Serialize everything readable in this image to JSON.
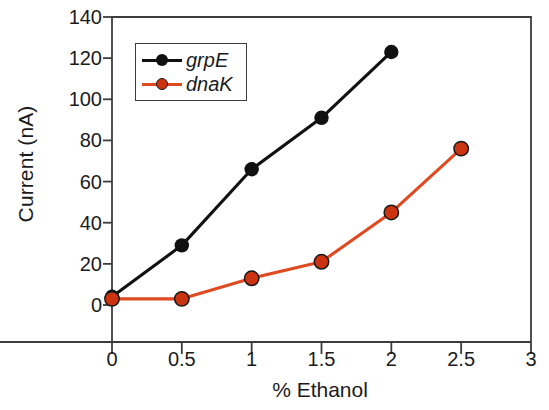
{
  "chart_data": {
    "type": "line",
    "title": "",
    "xlabel": "% Ethanol",
    "ylabel": "Current (nA)",
    "xlim": [
      0,
      3
    ],
    "ylim": [
      0,
      140
    ],
    "xticks": [
      "0",
      "0.5",
      "1",
      "1.5",
      "2",
      "2.5",
      "3"
    ],
    "xtick_values": [
      0,
      0.5,
      1,
      1.5,
      2,
      2.5,
      3
    ],
    "yticks": [
      "0",
      "20",
      "40",
      "60",
      "80",
      "100",
      "120",
      "140"
    ],
    "ytick_values": [
      0,
      20,
      40,
      60,
      80,
      100,
      120,
      140
    ],
    "grid": false,
    "legend_position": "upper left",
    "series": [
      {
        "name": "grpE",
        "color": "#111111",
        "marker": "circle",
        "x": [
          0,
          0.5,
          1,
          1.5,
          2
        ],
        "values": [
          4,
          29,
          66,
          91,
          123
        ]
      },
      {
        "name": "dnaK",
        "color": "#e04a20",
        "marker_color": "#cc3311",
        "marker": "circle",
        "x": [
          0,
          0.5,
          1,
          1.5,
          2,
          2.5
        ],
        "values": [
          3,
          3,
          13,
          21,
          45,
          76
        ]
      }
    ]
  },
  "legend": {
    "entries": [
      {
        "label": "grpE"
      },
      {
        "label": "dnaK"
      }
    ]
  },
  "axes": {
    "x_title": "% Ethanol",
    "y_title": "Current (nA)"
  },
  "colors": {
    "axis": "#3c3c3c",
    "grpE": "#111111",
    "dnaK_line": "#e04a20",
    "dnaK_marker": "#cc3311",
    "text": "#1b1b1b"
  }
}
